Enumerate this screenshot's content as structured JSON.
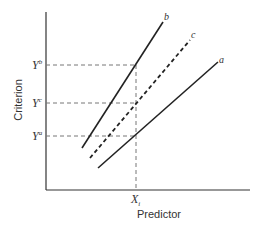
{
  "axes": {
    "xlabel": "Predictor",
    "ylabel": "Criterion"
  },
  "x_marker": {
    "base": "X",
    "sub": "i"
  },
  "y_markers": [
    {
      "base": "Y",
      "sup": "b"
    },
    {
      "base": "Y",
      "sup": "c"
    },
    {
      "base": "Y",
      "sup": "a"
    }
  ],
  "lines": [
    {
      "label": "b",
      "style": "solid"
    },
    {
      "label": "c",
      "style": "dashed"
    },
    {
      "label": "a",
      "style": "solid"
    }
  ],
  "colors": {
    "ink": "#222222",
    "guide": "#777777"
  }
}
